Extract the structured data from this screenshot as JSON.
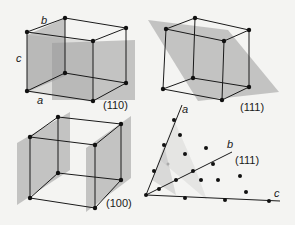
{
  "colors": {
    "background": "#f4f4f2",
    "plane": "#9a9a9a",
    "edge": "#1a1a1a",
    "dot": "#111111"
  },
  "panels": [
    {
      "id": "110",
      "label": "(110)",
      "axes": {
        "a": "a",
        "b": "b",
        "c": "c"
      }
    },
    {
      "id": "111",
      "label": "(111)",
      "axes": {
        "a": "a"
      }
    },
    {
      "id": "100",
      "label": "(100)"
    },
    {
      "id": "lattice111",
      "label": "(111)",
      "axes": {
        "a": "a",
        "b": "b",
        "c": "c"
      }
    }
  ]
}
